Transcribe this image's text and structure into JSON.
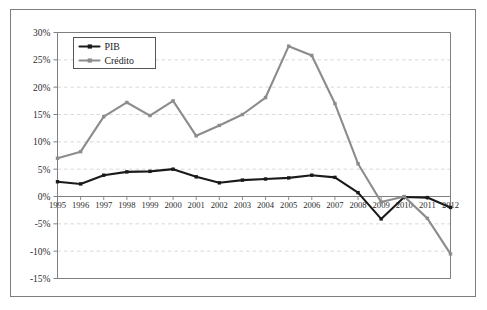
{
  "chart_data": {
    "type": "line",
    "title": "",
    "subtitle": "",
    "xlabel": "",
    "ylabel": "",
    "grid": true,
    "legend_position": "top-left",
    "x": [
      1995,
      1996,
      1997,
      1998,
      1999,
      2000,
      2001,
      2002,
      2003,
      2004,
      2005,
      2006,
      2007,
      2008,
      2009,
      2010,
      2011,
      2012
    ],
    "categories": [
      "1995",
      "1996",
      "1997",
      "1998",
      "1999",
      "2000",
      "2001",
      "2002",
      "2003",
      "2004",
      "2005",
      "2006",
      "2007",
      "2008",
      "2009",
      "2010",
      "2011",
      "2012"
    ],
    "xlim": [
      1995,
      2012
    ],
    "ylim": [
      -15,
      30
    ],
    "ytick_labels": [
      "30%",
      "25%",
      "20%",
      "15%",
      "10%",
      "5%",
      "0%",
      "-5%",
      "-10%",
      "-15%"
    ],
    "ytick_values": [
      30,
      25,
      20,
      15,
      10,
      5,
      0,
      -5,
      -10,
      -15
    ],
    "ytick_step": 5,
    "y_unit": "%",
    "series": [
      {
        "name": "PIB",
        "color": "#1a1a1a",
        "marker": "square",
        "values": [
          2.7,
          2.3,
          3.9,
          4.5,
          4.6,
          5.0,
          3.6,
          2.5,
          3.0,
          3.2,
          3.4,
          3.9,
          3.5,
          0.7,
          -4.1,
          -0.1,
          -0.2,
          -2.0
        ]
      },
      {
        "name": "Crédito",
        "color": "#8c8c8c",
        "marker": "square",
        "values": [
          7.0,
          8.2,
          14.6,
          17.2,
          14.8,
          17.5,
          11.1,
          13.0,
          15.0,
          18.1,
          27.5,
          25.8,
          17.0,
          6.0,
          -1.0,
          0.0,
          -4.0,
          -10.5
        ]
      }
    ]
  },
  "legend": {
    "items": [
      {
        "label": "PIB",
        "color": "#1a1a1a"
      },
      {
        "label": "Crédito",
        "color": "#8c8c8c"
      }
    ]
  },
  "colors": {
    "pib": "#1a1a1a",
    "credito": "#8c8c8c",
    "gridline": "#cfcfcf",
    "axis": "#808080",
    "frame": "#7d7d7d",
    "background": "#ffffff",
    "text": "#2b2b2b"
  }
}
